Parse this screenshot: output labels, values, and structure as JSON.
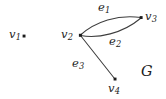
{
  "figure": {
    "kind": "graph-diagram",
    "name": "G",
    "width": 166,
    "height": 99,
    "background_color": "#ffffff",
    "ink_color": "#1c1c1c",
    "stroke_color": "#3d3d3d"
  },
  "vertices": [
    {
      "id": "v1",
      "label_main": "v",
      "label_sub": "1",
      "x": 24,
      "y": 36,
      "has_dot": true
    },
    {
      "id": "v2",
      "label_main": "v",
      "label_sub": "2",
      "x": 80,
      "y": 35,
      "has_dot": true
    },
    {
      "id": "v3",
      "label_main": "v",
      "label_sub": "3",
      "x": 141,
      "y": 17,
      "has_dot": true
    },
    {
      "id": "v4",
      "label_main": "v",
      "label_sub": "4",
      "x": 115,
      "y": 79,
      "has_dot": true
    }
  ],
  "edges": [
    {
      "id": "e1",
      "label_main": "e",
      "label_sub": "1",
      "from": "v2",
      "to": "v3",
      "shape": "curve-up"
    },
    {
      "id": "e2",
      "label_main": "e",
      "label_sub": "2",
      "from": "v2",
      "to": "v3",
      "shape": "curve-down"
    },
    {
      "id": "e3",
      "label_main": "e",
      "label_sub": "3",
      "from": "v2",
      "to": "v4",
      "shape": "straight"
    }
  ],
  "graph_label": {
    "text": "G"
  }
}
